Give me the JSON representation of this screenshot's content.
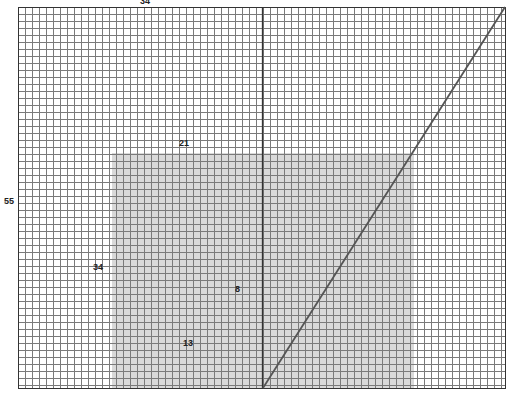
{
  "diagram": {
    "type": "golden-spiral-grid",
    "background": "#ffffff",
    "grid": {
      "left": 18,
      "top": 7,
      "right": 505,
      "bottom": 388,
      "cell_size": 7,
      "line_color": "#7a7a7a",
      "border_color": "#333333"
    },
    "shaded_region": {
      "x": 112,
      "y": 153,
      "width": 302,
      "height": 235,
      "color": "#d9d9d9"
    },
    "vertical_line": {
      "x": 262,
      "y1": 7,
      "y2": 388,
      "color": "#333333"
    },
    "diagonal_line": {
      "x1": 263,
      "y1": 388,
      "x2": 505,
      "y2": 7,
      "color": "#555555"
    },
    "labels": [
      {
        "text": "34",
        "x": 140,
        "y": -3
      },
      {
        "text": "55",
        "x": 4,
        "y": 197
      },
      {
        "text": "21",
        "x": 179,
        "y": 139
      },
      {
        "text": "34",
        "x": 93,
        "y": 263
      },
      {
        "text": "8",
        "x": 235,
        "y": 285
      },
      {
        "text": "13",
        "x": 183,
        "y": 339
      }
    ]
  }
}
